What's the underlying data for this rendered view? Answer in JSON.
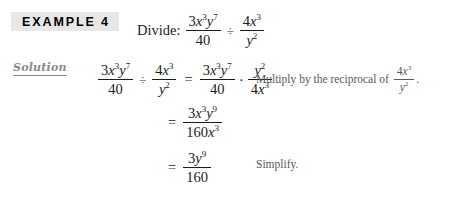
{
  "page": {
    "background": "#ffffff",
    "text_color": "#1c1c1c",
    "note_color": "#595959",
    "badge_background": "#e7e7e7",
    "solution_color": "#8a8a8a"
  },
  "example": {
    "badge_label": "EXAMPLE 4",
    "directive_label": "Divide:",
    "problem": {
      "left_fraction": {
        "numerator": {
          "coefficient": "3",
          "factors": [
            {
              "base": "x",
              "exponent": "3"
            },
            {
              "base": "y",
              "exponent": "7"
            }
          ]
        },
        "denominator": "40"
      },
      "operator": "÷",
      "right_fraction": {
        "numerator": {
          "coefficient": "4",
          "factors": [
            {
              "base": "x",
              "exponent": "3"
            }
          ]
        },
        "denominator": {
          "base": "y",
          "exponent": "2"
        }
      }
    }
  },
  "solution": {
    "label": "Solution",
    "steps": [
      {
        "step": 1,
        "lead": "",
        "expression_text": "3x^3y^7/40 ÷ 4x^3/y^2 = 3x^3y^7/40 · y^2/4x^3",
        "left": {
          "fraction_a": {
            "numerator": {
              "coefficient": "3",
              "factors": [
                {
                  "base": "x",
                  "exponent": "3"
                },
                {
                  "base": "y",
                  "exponent": "7"
                }
              ]
            },
            "denominator": "40"
          },
          "operator": "÷",
          "fraction_b": {
            "numerator": {
              "coefficient": "4",
              "factors": [
                {
                  "base": "x",
                  "exponent": "3"
                }
              ]
            },
            "denominator": {
              "base": "y",
              "exponent": "2"
            }
          }
        },
        "equals": "=",
        "right": {
          "fraction_a": {
            "numerator": {
              "coefficient": "3",
              "factors": [
                {
                  "base": "x",
                  "exponent": "3"
                },
                {
                  "base": "y",
                  "exponent": "7"
                }
              ]
            },
            "denominator": "40"
          },
          "operator": "·",
          "fraction_b": {
            "numerator": {
              "base": "y",
              "exponent": "2"
            },
            "denominator": {
              "coefficient": "4",
              "factors": [
                {
                  "base": "x",
                  "exponent": "3"
                }
              ]
            }
          }
        },
        "annotation": {
          "text": "Multiply by the reciprocal of",
          "fraction": {
            "numerator": {
              "coefficient": "4",
              "factors": [
                {
                  "base": "x",
                  "exponent": "3"
                }
              ]
            },
            "denominator": {
              "base": "y",
              "exponent": "2"
            }
          },
          "period": "."
        }
      },
      {
        "step": 2,
        "equals": "=",
        "expression_text": "3x^3y^9/160x^3",
        "result": {
          "numerator": {
            "coefficient": "3",
            "factors": [
              {
                "base": "x",
                "exponent": "3"
              },
              {
                "base": "y",
                "exponent": "9"
              }
            ]
          },
          "denominator": {
            "coefficient": "160",
            "factors": [
              {
                "base": "x",
                "exponent": "3"
              }
            ]
          }
        },
        "annotation": null
      },
      {
        "step": 3,
        "equals": "=",
        "expression_text": "3y^9/160",
        "result": {
          "numerator": {
            "coefficient": "3",
            "factors": [
              {
                "base": "y",
                "exponent": "9"
              }
            ]
          },
          "denominator": "160"
        },
        "annotation": {
          "text": "Simplify.",
          "fraction": null,
          "period": ""
        }
      }
    ]
  }
}
